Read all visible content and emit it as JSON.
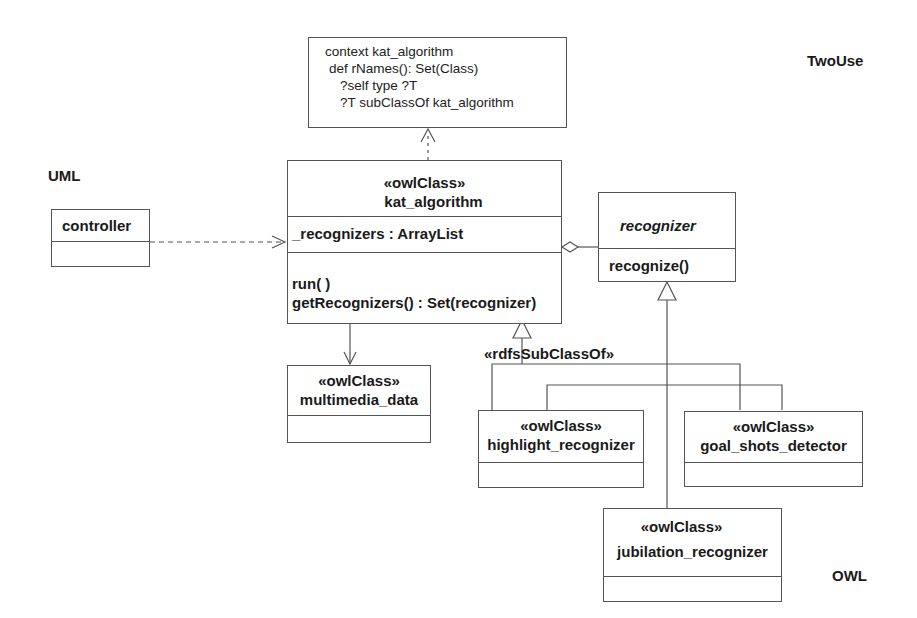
{
  "labels": {
    "twouse": "TwoUse",
    "uml": "UML",
    "owl": "OWL"
  },
  "note": {
    "lines": [
      "context kat_algorithm",
      " def rNames(): Set(Class)",
      "   ?self type ?T",
      "   ?T subClassOf kat_algorithm"
    ]
  },
  "classes": {
    "controller": {
      "name": "controller"
    },
    "kat_algorithm": {
      "stereotype": "«owlClass»",
      "name": "kat_algorithm",
      "attributes": [
        "_recognizers : ArrayList"
      ],
      "operations": [
        "run( )",
        "getRecognizers() : Set(recognizer)"
      ]
    },
    "recognizer": {
      "name": "recognizer",
      "operations": [
        "recognize()"
      ]
    },
    "multimedia_data": {
      "stereotype": "«owlClass»",
      "name": "multimedia_data"
    },
    "highlight_recognizer": {
      "stereotype": "«owlClass»",
      "name": "highlight_recognizer"
    },
    "goal_shots_detector": {
      "stereotype": "«owlClass»",
      "name": "goal_shots_detector"
    },
    "jubilation_recognizer": {
      "stereotype": "«owlClass»",
      "name": "jubilation_recognizer"
    }
  },
  "relations": {
    "subclass_stereotype": "«rdfsSubClassOf»"
  },
  "colors": {
    "line": "#555555",
    "text": "#1a1a1a",
    "background": "#ffffff"
  }
}
